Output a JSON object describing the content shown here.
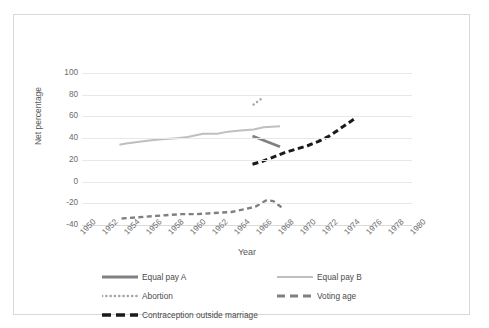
{
  "chart_data": {
    "type": "line",
    "title": "",
    "xlabel": "Year",
    "ylabel": "Net percentage",
    "xlim": [
      1950,
      1980
    ],
    "ylim": [
      -40,
      100
    ],
    "grid": true,
    "legend_position": "bottom",
    "xticks": [
      "1950",
      "1952",
      "1954",
      "1956",
      "1958",
      "1960",
      "1962",
      "1964",
      "1966",
      "1968",
      "1970",
      "1972",
      "1974",
      "1976",
      "1978",
      "1980"
    ],
    "yticks": [
      "100",
      "80",
      "60",
      "40",
      "20",
      "0",
      "-20",
      "-40"
    ],
    "series": [
      {
        "name": "Equal pay A",
        "color": "#808080",
        "style": "solid-thick",
        "points": [
          {
            "x": 1965.5,
            "y": 42
          },
          {
            "x": 1968.0,
            "y": 32
          }
        ]
      },
      {
        "name": "Equal pay B",
        "color": "#bfbfbf",
        "style": "solid-thin",
        "points": [
          {
            "x": 1953.4,
            "y": 34
          },
          {
            "x": 1954.0,
            "y": 35
          },
          {
            "x": 1955.4,
            "y": 37
          },
          {
            "x": 1956.3,
            "y": 38
          },
          {
            "x": 1957.3,
            "y": 39
          },
          {
            "x": 1958.6,
            "y": 40
          },
          {
            "x": 1959.6,
            "y": 41
          },
          {
            "x": 1961.0,
            "y": 44
          },
          {
            "x": 1962.3,
            "y": 44
          },
          {
            "x": 1963.3,
            "y": 46
          },
          {
            "x": 1964.4,
            "y": 47
          },
          {
            "x": 1965.6,
            "y": 48
          },
          {
            "x": 1966.5,
            "y": 50
          },
          {
            "x": 1968.0,
            "y": 51
          }
        ]
      },
      {
        "name": "Abortion",
        "color": "#a6a6a6",
        "style": "dotted",
        "points": [
          {
            "x": 1965.6,
            "y": 71
          },
          {
            "x": 1966.0,
            "y": 74
          },
          {
            "x": 1966.4,
            "y": 77
          }
        ]
      },
      {
        "name": "Voting age",
        "color": "#808080",
        "style": "dashed-medium",
        "points": [
          {
            "x": 1953.6,
            "y": -34
          },
          {
            "x": 1955.0,
            "y": -33
          },
          {
            "x": 1956.3,
            "y": -32
          },
          {
            "x": 1957.6,
            "y": -31
          },
          {
            "x": 1959.0,
            "y": -30
          },
          {
            "x": 1960.4,
            "y": -30
          },
          {
            "x": 1962.0,
            "y": -29
          },
          {
            "x": 1963.6,
            "y": -28
          },
          {
            "x": 1965.0,
            "y": -25
          },
          {
            "x": 1965.8,
            "y": -23
          },
          {
            "x": 1966.8,
            "y": -17
          },
          {
            "x": 1967.4,
            "y": -18
          },
          {
            "x": 1968.3,
            "y": -25
          }
        ]
      },
      {
        "name": "Contraception outside marriage",
        "color": "#1a1a1a",
        "style": "dashed-thick",
        "points": [
          {
            "x": 1965.5,
            "y": 16
          },
          {
            "x": 1966.5,
            "y": 19
          },
          {
            "x": 1967.5,
            "y": 23
          },
          {
            "x": 1968.5,
            "y": 27
          },
          {
            "x": 1969.5,
            "y": 30
          },
          {
            "x": 1970.5,
            "y": 33
          },
          {
            "x": 1971.5,
            "y": 37
          },
          {
            "x": 1972.5,
            "y": 42
          },
          {
            "x": 1973.5,
            "y": 49
          },
          {
            "x": 1974.8,
            "y": 58
          }
        ]
      }
    ]
  },
  "legend": {
    "items": [
      {
        "label": "Equal pay A",
        "key": "equal-pay-a"
      },
      {
        "label": "Equal pay B",
        "key": "equal-pay-b"
      },
      {
        "label": "Abortion",
        "key": "abortion"
      },
      {
        "label": "Voting age",
        "key": "voting-age"
      },
      {
        "label": "Contraception outside marriage",
        "key": "contraception-outside-marriage"
      }
    ]
  },
  "colors": {
    "gridline": "#e8e8e8",
    "axis": "#d9d9d9",
    "tick_text": "#6b6b6b",
    "title_text": "#595959",
    "frame": "#d9d9d9"
  }
}
